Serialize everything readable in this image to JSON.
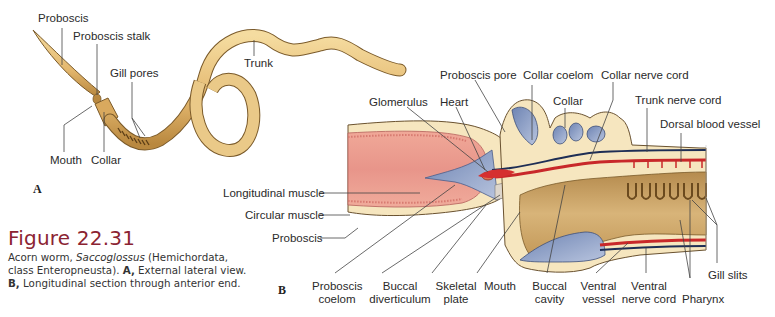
{
  "figure": {
    "number": "Figure 22.31",
    "caption": {
      "part1": "Acorn worm, ",
      "genus": "Saccoglossus",
      "part2": " (Hemichordata, class Enteropneusta). ",
      "a_label": "A,",
      "part3": " External lateral view. ",
      "b_label": "B,",
      "part4": " Longitudinal section through anterior end."
    },
    "title_color": "#8b2332"
  },
  "panel_a": {
    "tag": "A",
    "labels": {
      "proboscis": "Proboscis",
      "proboscis_stalk": "Proboscis stalk",
      "gill_pores": "Gill pores",
      "trunk": "Trunk",
      "mouth": "Mouth",
      "collar": "Collar"
    }
  },
  "panel_b": {
    "tag": "B",
    "labels": {
      "glomerulus": "Glomerulus",
      "heart": "Heart",
      "proboscis_pore": "Proboscis pore",
      "collar_coelom": "Collar coelom",
      "collar": "Collar",
      "collar_nerve_cord": "Collar nerve cord",
      "trunk_nerve_cord": "Trunk nerve cord",
      "dorsal_blood_vessel": "Dorsal blood vessel",
      "longitudinal_muscle": "Longitudinal muscle",
      "circular_muscle": "Circular muscle",
      "proboscis": "Proboscis",
      "proboscis_coelom_1": "Proboscis",
      "proboscis_coelom_2": "coelom",
      "buccal_diverticulum_1": "Buccal",
      "buccal_diverticulum_2": "diverticulum",
      "skeletal_plate_1": "Skeletal",
      "skeletal_plate_2": "plate",
      "mouth": "Mouth",
      "buccal_cavity_1": "Buccal",
      "buccal_cavity_2": "cavity",
      "ventral_vessel_1": "Ventral",
      "ventral_vessel_2": "vessel",
      "ventral_nerve_cord_1": "Ventral",
      "ventral_nerve_cord_2": "nerve cord",
      "pharynx": "Pharynx",
      "gill_slits": "Gill slits"
    }
  },
  "colors": {
    "worm_body": "#e9c47e",
    "worm_outline": "#7a5a2a",
    "muscle": "#e89a8a",
    "coelom_blue": "#8fa3c8",
    "vessel_red": "#c8282a",
    "nerve_dark": "#1e2e55",
    "tissue_cream": "#f6e6bf",
    "gut_tan": "#c9a064"
  }
}
